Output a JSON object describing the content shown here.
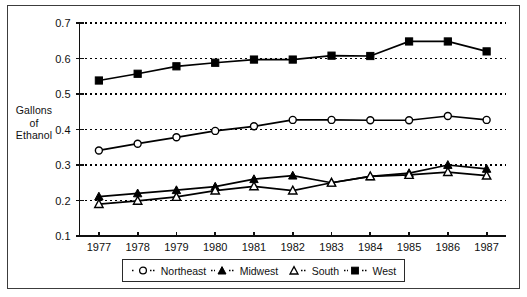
{
  "chart_data": {
    "type": "line",
    "title": "",
    "xlabel": "",
    "ylabel": "Gallons of Ethanol",
    "ylabel_lines": [
      "Gallons",
      "of",
      "Ethanol"
    ],
    "categories": [
      "1977",
      "1978",
      "1979",
      "1980",
      "1981",
      "1982",
      "1983",
      "1984",
      "1985",
      "1986",
      "1987"
    ],
    "x": [
      1977,
      1978,
      1979,
      1980,
      1981,
      1982,
      1983,
      1984,
      1985,
      1986,
      1987
    ],
    "ylim": [
      0.1,
      0.7
    ],
    "yticks": [
      "0.1",
      "0.2",
      "0.3",
      "0.4",
      "0.5",
      "0.6",
      "0.7"
    ],
    "ytick_values": [
      0.1,
      0.2,
      0.3,
      0.4,
      0.5,
      0.6,
      0.7
    ],
    "grid": true,
    "grid_style": "dotted-horizontal",
    "legend_position": "bottom",
    "series": [
      {
        "name": "Northeast",
        "marker": "open-circle",
        "values": [
          0.341,
          0.36,
          0.378,
          0.396,
          0.409,
          0.427,
          0.427,
          0.426,
          0.426,
          0.438,
          0.427
        ]
      },
      {
        "name": "Midwest",
        "marker": "filled-triangle",
        "values": [
          0.211,
          0.22,
          0.229,
          0.239,
          0.26,
          0.27,
          0.25,
          0.268,
          0.277,
          0.3,
          0.289
        ]
      },
      {
        "name": "South",
        "marker": "open-triangle",
        "values": [
          0.19,
          0.199,
          0.21,
          0.228,
          0.24,
          0.228,
          0.25,
          0.268,
          0.272,
          0.28,
          0.27
        ]
      },
      {
        "name": "West",
        "marker": "filled-square",
        "values": [
          0.538,
          0.557,
          0.578,
          0.588,
          0.597,
          0.597,
          0.608,
          0.607,
          0.648,
          0.648,
          0.62
        ]
      }
    ]
  },
  "legend": {
    "items": [
      {
        "label": "Northeast",
        "marker": "open-circle"
      },
      {
        "label": "Midwest",
        "marker": "filled-triangle"
      },
      {
        "label": "South",
        "marker": "open-triangle"
      },
      {
        "label": "West",
        "marker": "filled-square"
      }
    ]
  },
  "colors": {
    "line": "#000000",
    "axis": "#101010",
    "grid": "#000000",
    "frame": "#3c3c3c",
    "background": "#ffffff"
  }
}
